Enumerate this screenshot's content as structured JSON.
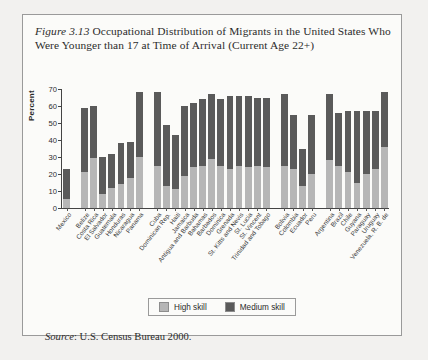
{
  "figure": {
    "label": "Figure 3.13",
    "title": "Occupational Distribution of Migrants in the United States Who Were Younger than 17 at Time of Arrival (Current Age 22+)",
    "source_label": "Source",
    "source_text": ": U.S. Census Bureau 2000."
  },
  "legend": {
    "high_label": "High skill",
    "medium_label": "Medium skill",
    "high_color": "#b6b6b6",
    "medium_color": "#5a5a5a",
    "position": "bottom-center"
  },
  "chart_data": {
    "type": "bar",
    "stacked": true,
    "title": "Occupational Distribution of Migrants in the United States Who Were Younger than 17 at Time of Arrival (Current Age 22+)",
    "xlabel": "",
    "ylabel": "Percent",
    "ylim": [
      0,
      70
    ],
    "yticks": [
      0,
      10,
      20,
      30,
      40,
      50,
      60,
      70
    ],
    "grid": false,
    "categories": [
      "Mexico",
      "Belize",
      "Costa Rica",
      "El Salvador",
      "Guatemala",
      "Honduras",
      "Nicaragua",
      "Panama",
      "Cuba",
      "Dominican Rep.",
      "Haiti",
      "Jamaica",
      "Antigua and Barbuda",
      "Bahamas",
      "Barbados",
      "Dominica",
      "Grenada",
      "St. Kitts and Nevis",
      "St. Lucia",
      "St. Vincent",
      "Trinidad and Tobago",
      "Bolivia",
      "Colombia",
      "Ecuador",
      "Peru",
      "Argentina",
      "Brazil",
      "Chile",
      "Guyana",
      "Paraguay",
      "Uruguay",
      "Venezuela, R. B. de"
    ],
    "group_gaps_after": [
      "Mexico",
      "Panama",
      "Trinidad and Tobago",
      "Peru"
    ],
    "series": [
      {
        "name": "High skill",
        "color": "#b6b6b6",
        "values": [
          5.5,
          21,
          29.5,
          8,
          12,
          14,
          17.5,
          30,
          25,
          13,
          11,
          19,
          24,
          25,
          29,
          25,
          23,
          25,
          24,
          25,
          24,
          25,
          23,
          13,
          20,
          28,
          25,
          21,
          15,
          20,
          23,
          36
        ]
      },
      {
        "name": "Medium skill",
        "color": "#5a5a5a",
        "values": [
          17.5,
          38,
          30.5,
          22,
          20,
          24,
          21.5,
          38,
          43,
          36,
          32,
          41,
          38,
          39,
          38,
          39,
          43,
          41,
          42,
          40,
          41,
          42,
          32,
          22,
          35,
          39,
          31,
          36,
          42,
          37,
          34,
          32
        ]
      }
    ],
    "totals": [
      23,
      59,
      60,
      30,
      32,
      38,
      39,
      68,
      68,
      49,
      43,
      60,
      62,
      64,
      67,
      64,
      66,
      66,
      66,
      65,
      65,
      67,
      55,
      35,
      55,
      67,
      56,
      57,
      57,
      57,
      57,
      68
    ]
  }
}
